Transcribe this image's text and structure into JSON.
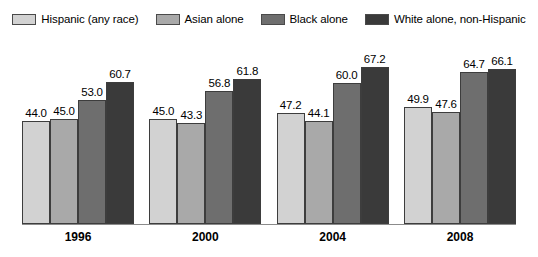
{
  "chart_data": {
    "type": "bar",
    "title": "",
    "subtitle": "",
    "xlabel": "",
    "ylabel": "",
    "ylim": [
      0,
      70
    ],
    "grid": false,
    "legend_position": "top",
    "categories": [
      "1996",
      "2000",
      "2004",
      "2008"
    ],
    "series": [
      {
        "name": "Hispanic (any race)",
        "color": "#d2d2d2",
        "values": [
          44.0,
          45.0,
          47.2,
          49.9
        ],
        "labels": [
          "44.0",
          "45.0",
          "47.2",
          "49.9"
        ]
      },
      {
        "name": "Asian alone",
        "color": "#a9a9a9",
        "values": [
          45.0,
          43.3,
          44.1,
          47.6
        ],
        "labels": [
          "45.0",
          "43.3",
          "44.1",
          "47.6"
        ]
      },
      {
        "name": "Black alone",
        "color": "#6e6e6e",
        "values": [
          53.0,
          56.8,
          60.0,
          64.7
        ],
        "labels": [
          "53.0",
          "56.8",
          "60.0",
          "64.7"
        ]
      },
      {
        "name": "White alone, non-Hispanic",
        "color": "#3a3a3a",
        "values": [
          60.7,
          61.8,
          67.2,
          66.1
        ],
        "labels": [
          "60.7",
          "61.8",
          "67.2",
          "66.1"
        ]
      }
    ]
  },
  "legend": {
    "items": [
      {
        "label": "Hispanic (any race)",
        "color": "#d2d2d2"
      },
      {
        "label": "Asian alone",
        "color": "#a9a9a9"
      },
      {
        "label": "Black alone",
        "color": "#6e6e6e"
      },
      {
        "label": "White alone, non-Hispanic",
        "color": "#3a3a3a"
      }
    ]
  },
  "axis": {
    "ticks": [
      "1996",
      "2000",
      "2004",
      "2008"
    ],
    "baseline_color": "#8b8b8b"
  }
}
